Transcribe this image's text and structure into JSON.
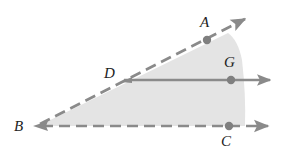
{
  "diagram": {
    "type": "geometry-angle-interior",
    "colors": {
      "shade": "#e4e4e4",
      "line": "#8a8a8a",
      "point": "#7f7f7f",
      "label": "#222222"
    },
    "points": [
      {
        "id": "A",
        "label": "A",
        "x": 207,
        "y": 40,
        "label_x": 200,
        "label_y": 27
      },
      {
        "id": "B",
        "label": "B",
        "x": 36,
        "y": 126,
        "label_x": 14,
        "label_y": 131
      },
      {
        "id": "C",
        "label": "C",
        "x": 229,
        "y": 126,
        "label_x": 221,
        "label_y": 146
      },
      {
        "id": "D",
        "label": "D",
        "x": 124,
        "y": 80,
        "label_x": 104,
        "label_y": 78
      },
      {
        "id": "G",
        "label": "G",
        "x": 231,
        "y": 80,
        "label_x": 224,
        "label_y": 67
      }
    ],
    "rays": [
      {
        "id": "ray-BA",
        "from": "B",
        "through": "A",
        "style": "dashed",
        "end": [
          247,
          18
        ]
      },
      {
        "id": "ray-BC",
        "from": "B",
        "through": "C",
        "style": "dashed",
        "end": [
          270,
          126
        ]
      },
      {
        "id": "ray-DG",
        "from": "D",
        "through": "G",
        "style": "solid",
        "end": [
          272,
          80
        ]
      }
    ],
    "shaded_region": "interior of angle ABC"
  }
}
